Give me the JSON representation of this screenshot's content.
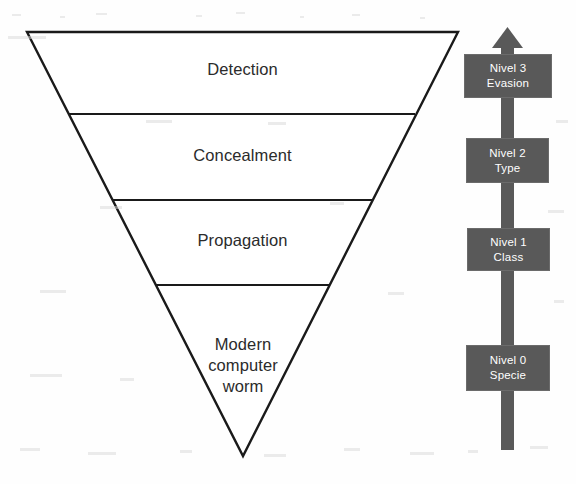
{
  "diagram": {
    "type": "inverted-pyramid-with-level-axis",
    "background_color": "#fefefe",
    "outline_color": "#1a1a1a",
    "box_fill_color": "#595959",
    "box_text_color": "#ffffff",
    "funnel": {
      "name": "modern-computer-worm-funnel",
      "bands": [
        {
          "id": "detection",
          "label": "Detection"
        },
        {
          "id": "concealment",
          "label": "Concealment"
        },
        {
          "id": "propagation",
          "label": "Propagation"
        },
        {
          "id": "core",
          "label": "Modern\ncomputer\nworm"
        }
      ]
    },
    "axis": {
      "name": "nivel-axis",
      "direction": "upward",
      "arrow_icon": "up-arrow-icon",
      "levels": [
        {
          "id": "nivel-3",
          "level": "Nivel 3",
          "name": "Evasion"
        },
        {
          "id": "nivel-2",
          "level": "Nivel 2",
          "name": "Type"
        },
        {
          "id": "nivel-1",
          "level": "Nivel 1",
          "name": "Class"
        },
        {
          "id": "nivel-0",
          "level": "Nivel 0",
          "name": "Specie"
        }
      ]
    }
  }
}
